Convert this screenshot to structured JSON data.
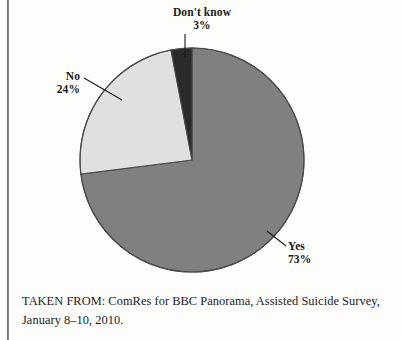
{
  "figure": {
    "background_color": "#fdfdfb",
    "caption": "TAKEN FROM: ComRes for BBC Panorama, Assisted Suicide Survey, January 8–10, 2010."
  },
  "chart_data": {
    "type": "pie",
    "title": "",
    "subtitle": "",
    "xlabel": "",
    "ylabel": "",
    "grid": false,
    "legend_position": "none",
    "labels_position": "outside-with-leader-lines",
    "start_angle_deg": 0,
    "direction": "clockwise",
    "units": "percent",
    "total": 100,
    "categories": [
      "Yes",
      "No",
      "Don't know"
    ],
    "values": [
      73,
      24,
      3
    ],
    "colors": [
      "#808080",
      "#e0e0e0",
      "#2a2a2a"
    ],
    "slices": [
      {
        "label": "Yes",
        "value": 73,
        "value_text": "73%",
        "color": "#808080",
        "start_deg": 0,
        "end_deg": 262.8,
        "label_x": 288,
        "label_y": 240
      },
      {
        "label": "No",
        "value": 24,
        "value_text": "24%",
        "color": "#e0e0e0",
        "start_deg": 262.8,
        "end_deg": 349.2,
        "label_x": 24,
        "label_y": 70
      },
      {
        "label": "Don't know",
        "value": 3,
        "value_text": "3%",
        "color": "#2a2a2a",
        "start_deg": 349.2,
        "end_deg": 360,
        "label_x": 146,
        "label_y": 6
      }
    ],
    "geometry": {
      "center_x": 192,
      "center_y": 160,
      "radius": 112,
      "outline_color": "#4a4a4a"
    }
  },
  "labels": {
    "dont_know": {
      "name": "Don't know",
      "value": "3%"
    },
    "no": {
      "name": "No",
      "value": "24%"
    },
    "yes": {
      "name": "Yes",
      "value": "73%"
    }
  }
}
